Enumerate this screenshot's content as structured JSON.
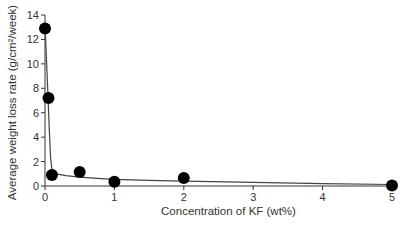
{
  "chart_data": {
    "type": "scatter",
    "title": "",
    "xlabel": "Concentration of KF (wt%)",
    "ylabel": "Average weight loss rate (g/cm²/week)",
    "xlim": [
      0,
      5
    ],
    "ylim": [
      0,
      14
    ],
    "x_ticks": [
      0,
      1,
      2,
      3,
      4,
      5
    ],
    "y_ticks": [
      0,
      2,
      4,
      6,
      8,
      10,
      12,
      14
    ],
    "grid": false,
    "legend": null,
    "series": [
      {
        "name": "Measured",
        "marker": "filled-circle",
        "color": "#000000",
        "x": [
          0,
          0.05,
          0.1,
          0.5,
          1,
          2,
          5
        ],
        "y": [
          12.9,
          7.2,
          0.9,
          1.15,
          0.35,
          0.65,
          0.05
        ]
      },
      {
        "name": "Fitted curve",
        "line": "solid",
        "color": "#555555",
        "x": [
          0,
          0.02,
          0.04,
          0.06,
          0.08,
          0.1,
          0.15,
          0.2,
          0.3,
          0.5,
          0.75,
          1,
          1.5,
          2,
          3,
          4,
          5
        ],
        "y": [
          13.2,
          10.5,
          7.8,
          4.8,
          2.3,
          1.35,
          1.05,
          0.95,
          0.85,
          0.72,
          0.62,
          0.55,
          0.47,
          0.4,
          0.3,
          0.2,
          0.12
        ]
      }
    ]
  }
}
